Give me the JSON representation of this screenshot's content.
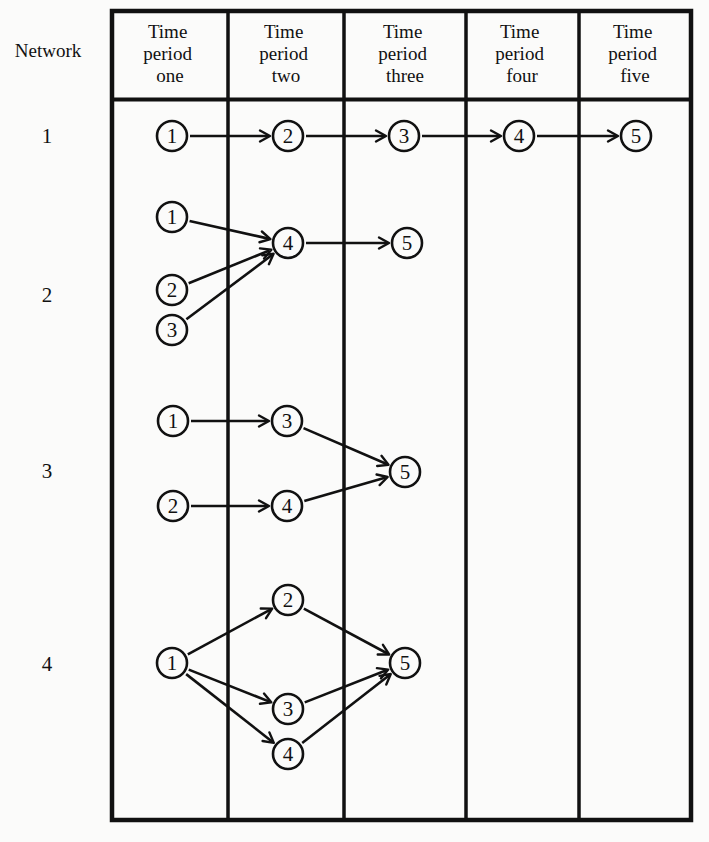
{
  "header": {
    "row_label": "Network",
    "columns": [
      {
        "lines": [
          "Time",
          "period",
          "one"
        ]
      },
      {
        "lines": [
          "Time",
          "period",
          "two"
        ]
      },
      {
        "lines": [
          "Time",
          "period",
          "three"
        ]
      },
      {
        "lines": [
          "Time",
          "period",
          "four"
        ]
      },
      {
        "lines": [
          "Time",
          "period",
          "five"
        ]
      }
    ]
  },
  "networks": [
    {
      "label": "1",
      "label_y": 136,
      "nodes": [
        {
          "id": "1",
          "x": 172,
          "y": 136
        },
        {
          "id": "2",
          "x": 288,
          "y": 136
        },
        {
          "id": "3",
          "x": 404,
          "y": 136
        },
        {
          "id": "4",
          "x": 519,
          "y": 136
        },
        {
          "id": "5",
          "x": 636,
          "y": 136
        }
      ],
      "edges": [
        [
          "1",
          "2"
        ],
        [
          "2",
          "3"
        ],
        [
          "3",
          "4"
        ],
        [
          "4",
          "5"
        ]
      ]
    },
    {
      "label": "2",
      "label_y": 295,
      "nodes": [
        {
          "id": "1",
          "x": 172,
          "y": 217
        },
        {
          "id": "2",
          "x": 172,
          "y": 290
        },
        {
          "id": "3",
          "x": 172,
          "y": 330
        },
        {
          "id": "4",
          "x": 288,
          "y": 243
        },
        {
          "id": "5",
          "x": 407,
          "y": 243
        }
      ],
      "edges": [
        [
          "1",
          "4"
        ],
        [
          "2",
          "4"
        ],
        [
          "3",
          "4"
        ],
        [
          "4",
          "5"
        ]
      ]
    },
    {
      "label": "3",
      "label_y": 471,
      "nodes": [
        {
          "id": "1",
          "x": 173,
          "y": 421
        },
        {
          "id": "2",
          "x": 173,
          "y": 506
        },
        {
          "id": "3",
          "x": 287,
          "y": 421
        },
        {
          "id": "4",
          "x": 287,
          "y": 506
        },
        {
          "id": "5",
          "x": 405,
          "y": 472
        }
      ],
      "edges": [
        [
          "1",
          "3"
        ],
        [
          "2",
          "4"
        ],
        [
          "3",
          "5"
        ],
        [
          "4",
          "5"
        ]
      ]
    },
    {
      "label": "4",
      "label_y": 664,
      "nodes": [
        {
          "id": "1",
          "x": 172,
          "y": 663
        },
        {
          "id": "2",
          "x": 288,
          "y": 600
        },
        {
          "id": "3",
          "x": 288,
          "y": 709
        },
        {
          "id": "4",
          "x": 288,
          "y": 754
        },
        {
          "id": "5",
          "x": 405,
          "y": 663
        }
      ],
      "edges": [
        [
          "1",
          "2"
        ],
        [
          "1",
          "3"
        ],
        [
          "1",
          "4"
        ],
        [
          "2",
          "5"
        ],
        [
          "3",
          "5"
        ],
        [
          "4",
          "5"
        ]
      ]
    }
  ],
  "colors": {
    "ink": "#111111",
    "paper": "#fbfbfa"
  }
}
